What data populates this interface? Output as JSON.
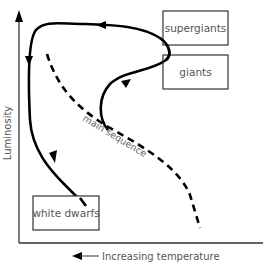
{
  "diagram": {
    "type": "Hertzsprung-Russell evolutionary track",
    "y_axis": {
      "label": "Luminosity",
      "direction": "up"
    },
    "x_axis": {
      "label": "Increasing temperature",
      "direction": "left"
    },
    "regions": [
      {
        "id": "supergiants",
        "label": "supergiants"
      },
      {
        "id": "giants",
        "label": "giants"
      },
      {
        "id": "white-dwarfs",
        "label": "white dwarfs"
      }
    ],
    "main_sequence": {
      "label": "main sequence",
      "style": "dashed"
    },
    "evolution_path": {
      "style": "solid",
      "arrows": 3
    },
    "colors": {
      "line": "#000000",
      "axis": "#333333",
      "text": "#555555",
      "box_border": "#333333",
      "background": "#ffffff"
    }
  }
}
